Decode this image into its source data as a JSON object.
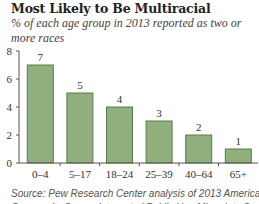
{
  "title": "Most Likely to Be Multiracial",
  "subtitle": "% of each age group in 2013 reported as two or more races",
  "source_line1": "Source: Pew Research Center analysis of 2013 American",
  "source_line2": "Community Survey Integrated Public Use Microdata Series",
  "colors": {
    "bar": "#8faf7d",
    "bar_border": "#5a7a4d",
    "axis": "#555555"
  },
  "chart_data": {
    "type": "bar",
    "title": "Most Likely to Be Multiracial",
    "subtitle": "% of each age group in 2013 reported as two or more races",
    "categories": [
      "0–4",
      "5–17",
      "18–24",
      "25–39",
      "40–64",
      "65+"
    ],
    "values": [
      7,
      5,
      4,
      3,
      2,
      1
    ],
    "data_labels": [
      "7",
      "5",
      "4",
      "3",
      "2",
      "1"
    ],
    "xlabel": "",
    "ylabel": "",
    "ylim": [
      0,
      8
    ],
    "yticks": [
      0,
      2,
      4,
      6,
      8
    ],
    "grid": false,
    "legend": null
  }
}
